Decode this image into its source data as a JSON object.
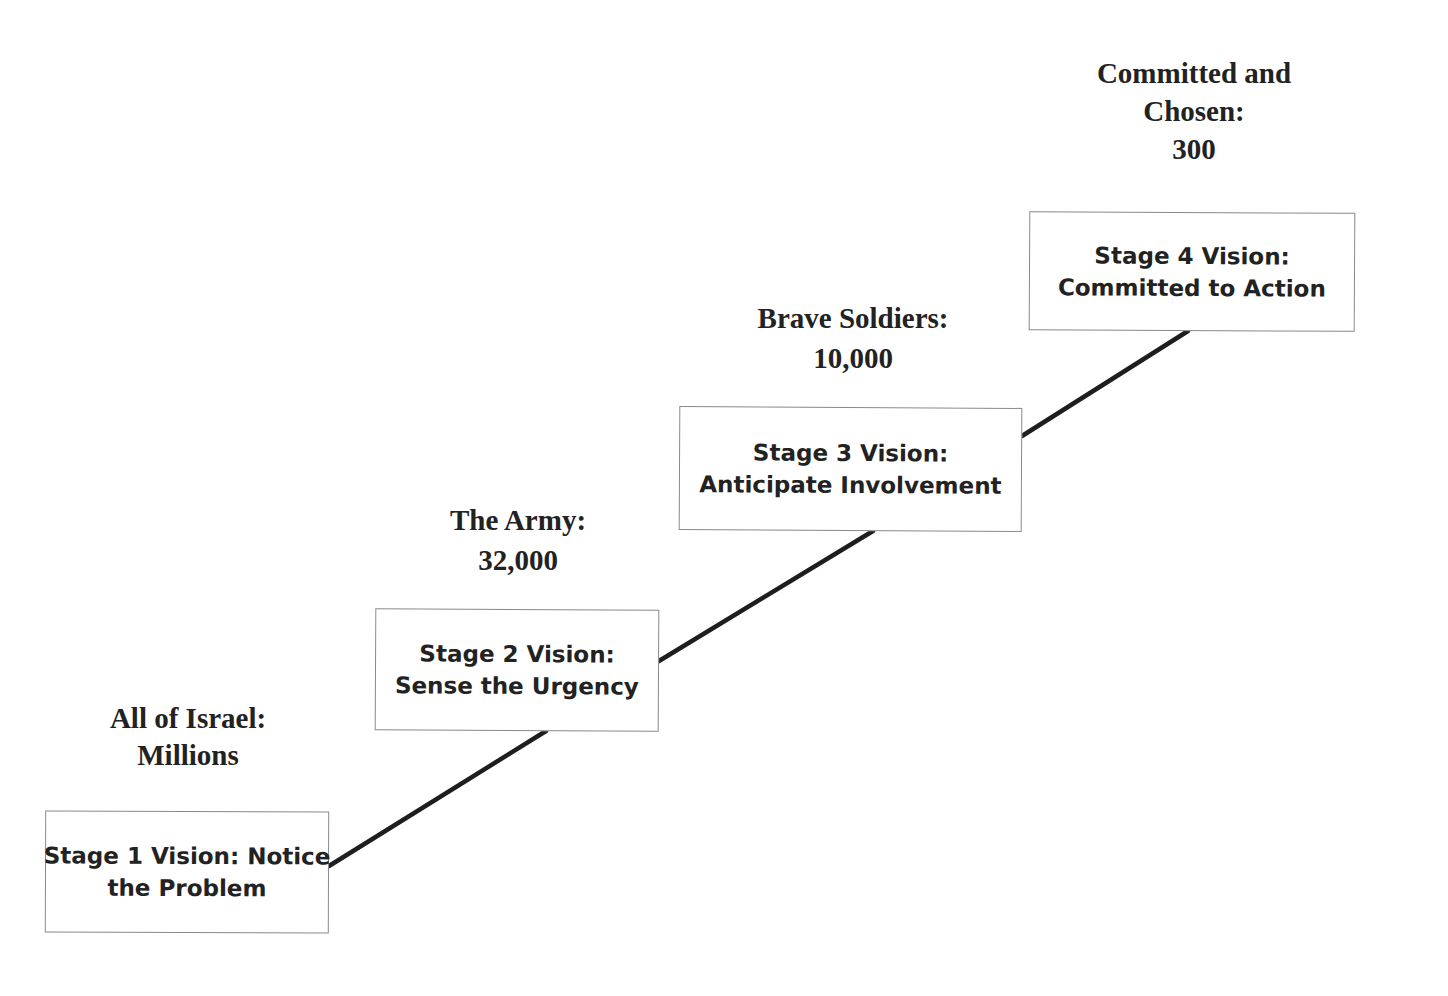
{
  "diagram": {
    "type": "staircase-progression",
    "colors": {
      "background": "#ffffff",
      "text": "#222222",
      "box_border": "#8a8a8a",
      "connector": "#1e1e1e"
    },
    "stages": [
      {
        "caption": {
          "line1": "All of Israel:",
          "line2": "Millions"
        },
        "box": {
          "line1": "Stage 1 Vision: Notice",
          "line2": "the Problem"
        }
      },
      {
        "caption": {
          "line1": "The Army:",
          "line2": "32,000"
        },
        "box": {
          "line1": "Stage 2 Vision:",
          "line2": "Sense the Urgency"
        }
      },
      {
        "caption": {
          "line1": "Brave Soldiers:",
          "line2": "10,000"
        },
        "box": {
          "line1": "Stage 3 Vision:",
          "line2": "Anticipate Involvement"
        }
      },
      {
        "caption": {
          "line1": "Committed and",
          "line2": "Chosen:",
          "line3": "300"
        },
        "box": {
          "line1": "Stage 4 Vision:",
          "line2": "Committed to Action"
        }
      }
    ]
  }
}
